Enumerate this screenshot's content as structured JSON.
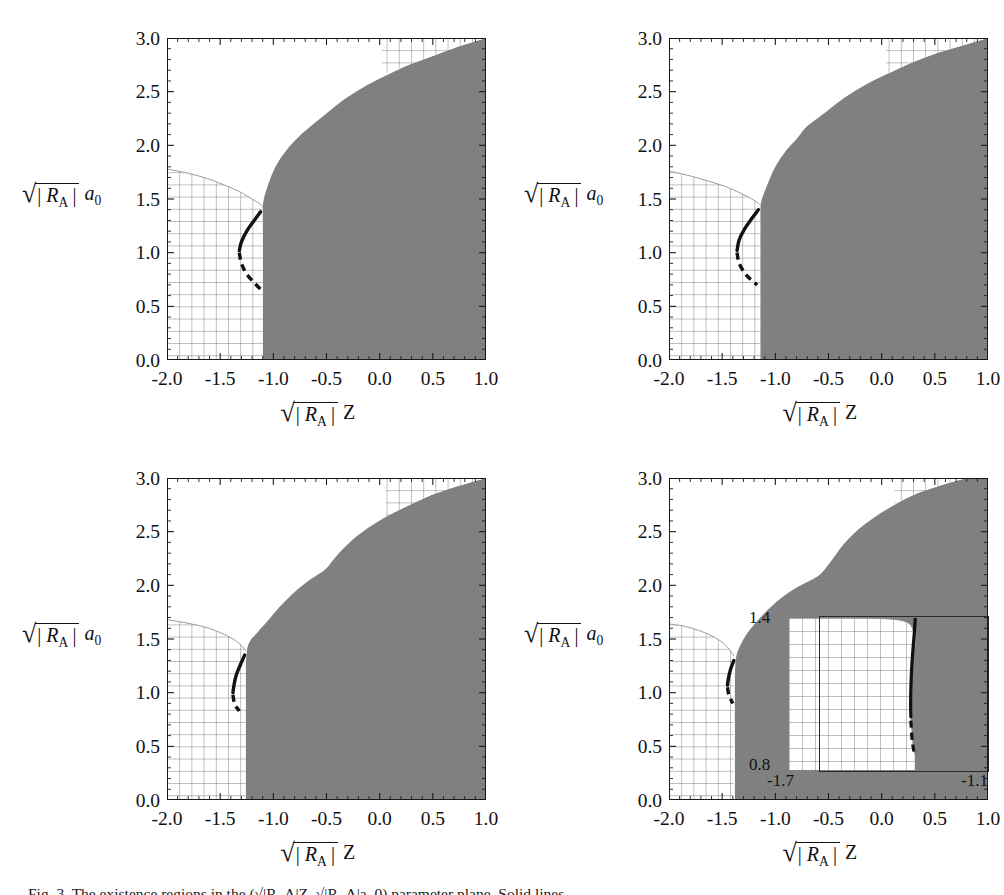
{
  "figure": {
    "panel_count": 4,
    "caption": "Fig. 3.  The existence regions in the (√|R_A|Z, √|R_A|a_0) parameter plane. Solid lines..."
  },
  "axes": {
    "x": {
      "label_parts": {
        "radical": "√",
        "bars_open": "|",
        "sym": "R",
        "sub": "A",
        "bars_close": "|",
        "var": "Z"
      },
      "ticks": [
        "-2.0",
        "-1.5",
        "-1.0",
        "-0.5",
        "0.0",
        "0.5",
        "1.0"
      ],
      "tick_values": [
        -2.0,
        -1.5,
        -1.0,
        -0.5,
        0.0,
        0.5,
        1.0
      ],
      "min": -2.0,
      "max": 1.0,
      "minor_per_major": 5
    },
    "y": {
      "label_parts": {
        "radical": "√",
        "bars_open": "|",
        "sym": "R",
        "sub": "A",
        "bars_close": "|",
        "var": "a",
        "var_sub": "0"
      },
      "ticks": [
        "0.0",
        "0.5",
        "1.0",
        "1.5",
        "2.0",
        "2.5",
        "3.0"
      ],
      "tick_values": [
        0.0,
        0.5,
        1.0,
        1.5,
        2.0,
        2.5,
        3.0
      ],
      "min": 0.0,
      "max": 3.0,
      "minor_per_major": 5
    }
  },
  "colors": {
    "shaded_region": "#808080",
    "curve": "#111111",
    "hatch_line": "#6b6b6b",
    "frame": "#1a1a1a",
    "background": "#ffffff"
  },
  "inset": {
    "panel": 3,
    "x_ticks": [
      "-1.7",
      "-1.1"
    ],
    "y_ticks": [
      "0.8",
      "1.4"
    ],
    "x_min": -1.7,
    "x_max": -1.1,
    "y_min": 0.8,
    "y_max": 1.4
  },
  "chart_data": {
    "type": "area",
    "title": "",
    "xlabel": "sqrt(|R_A|) Z",
    "ylabel": "sqrt(|R_A|) a_0",
    "xlim": [
      -2.0,
      1.0
    ],
    "ylim": [
      0.0,
      3.0
    ],
    "grid": false,
    "legend": "none",
    "panels": [
      {
        "id": "top-left",
        "shaded_boundary": [
          [
            -1.1,
            0.0
          ],
          [
            -1.1,
            0.6
          ],
          [
            -1.1,
            1.1
          ],
          [
            -1.1,
            1.42
          ],
          [
            -1.06,
            1.6
          ],
          [
            -0.98,
            1.8
          ],
          [
            -0.88,
            1.95
          ],
          [
            -0.76,
            2.08
          ],
          [
            -0.62,
            2.2
          ],
          [
            -0.46,
            2.33
          ],
          [
            -0.3,
            2.45
          ],
          [
            -0.12,
            2.56
          ],
          [
            0.08,
            2.66
          ],
          [
            0.3,
            2.76
          ],
          [
            0.52,
            2.84
          ],
          [
            0.74,
            2.92
          ],
          [
            1.0,
            3.0
          ]
        ],
        "hatch_left_boundary": [
          [
            -2.0,
            1.78
          ],
          [
            -1.8,
            1.74
          ],
          [
            -1.62,
            1.69
          ],
          [
            -1.46,
            1.63
          ],
          [
            -1.32,
            1.57
          ],
          [
            -1.2,
            1.5
          ],
          [
            -1.12,
            1.45
          ],
          [
            -1.1,
            1.42
          ]
        ],
        "hatch_topright_boundary": [
          [
            0.02,
            2.66
          ],
          [
            0.3,
            2.76
          ],
          [
            0.52,
            2.84
          ],
          [
            0.74,
            2.92
          ],
          [
            1.0,
            3.0
          ]
        ],
        "hatch_topright_xmin": 0.02,
        "hatch_topright_ymax": 3.0,
        "curve_solid": [
          [
            -1.12,
            1.38
          ],
          [
            -1.18,
            1.3
          ],
          [
            -1.25,
            1.2
          ],
          [
            -1.3,
            1.1
          ],
          [
            -1.32,
            1.02
          ]
        ],
        "curve_dashed": [
          [
            -1.32,
            1.0
          ],
          [
            -1.3,
            0.9
          ],
          [
            -1.25,
            0.8
          ],
          [
            -1.18,
            0.72
          ],
          [
            -1.12,
            0.66
          ]
        ]
      },
      {
        "id": "top-right",
        "shaded_boundary": [
          [
            -1.15,
            0.0
          ],
          [
            -1.15,
            0.7
          ],
          [
            -1.15,
            1.2
          ],
          [
            -1.14,
            1.44
          ],
          [
            -1.08,
            1.62
          ],
          [
            -1.0,
            1.8
          ],
          [
            -0.9,
            1.95
          ],
          [
            -0.8,
            2.06
          ],
          [
            -0.72,
            2.16
          ],
          [
            -0.62,
            2.24
          ],
          [
            -0.5,
            2.33
          ],
          [
            -0.34,
            2.45
          ],
          [
            -0.16,
            2.56
          ],
          [
            0.04,
            2.66
          ],
          [
            0.28,
            2.77
          ],
          [
            0.52,
            2.86
          ],
          [
            0.76,
            2.93
          ],
          [
            1.0,
            3.0
          ]
        ],
        "hatch_left_boundary": [
          [
            -2.0,
            1.76
          ],
          [
            -1.82,
            1.72
          ],
          [
            -1.64,
            1.67
          ],
          [
            -1.48,
            1.62
          ],
          [
            -1.34,
            1.56
          ],
          [
            -1.22,
            1.5
          ],
          [
            -1.16,
            1.46
          ],
          [
            -1.14,
            1.44
          ]
        ],
        "hatch_topright_boundary": [
          [
            0.04,
            2.66
          ],
          [
            0.28,
            2.77
          ],
          [
            0.52,
            2.86
          ],
          [
            0.76,
            2.93
          ],
          [
            1.0,
            3.0
          ]
        ],
        "hatch_topright_xmin": 0.04,
        "hatch_topright_ymax": 3.0,
        "curve_solid": [
          [
            -1.16,
            1.4
          ],
          [
            -1.22,
            1.32
          ],
          [
            -1.29,
            1.22
          ],
          [
            -1.34,
            1.12
          ],
          [
            -1.36,
            1.02
          ]
        ],
        "curve_dashed": [
          [
            -1.36,
            1.0
          ],
          [
            -1.34,
            0.9
          ],
          [
            -1.28,
            0.8
          ],
          [
            -1.22,
            0.74
          ],
          [
            -1.17,
            0.7
          ]
        ]
      },
      {
        "id": "bottom-left",
        "shaded_boundary": [
          [
            -1.26,
            0.0
          ],
          [
            -1.26,
            0.7
          ],
          [
            -1.26,
            1.15
          ],
          [
            -1.25,
            1.38
          ],
          [
            -1.22,
            1.48
          ],
          [
            -1.16,
            1.55
          ],
          [
            -1.06,
            1.66
          ],
          [
            -0.94,
            1.8
          ],
          [
            -0.82,
            1.92
          ],
          [
            -0.7,
            2.02
          ],
          [
            -0.58,
            2.1
          ],
          [
            -0.5,
            2.16
          ],
          [
            -0.4,
            2.28
          ],
          [
            -0.26,
            2.42
          ],
          [
            -0.1,
            2.54
          ],
          [
            0.06,
            2.64
          ],
          [
            0.26,
            2.74
          ],
          [
            0.48,
            2.84
          ],
          [
            0.72,
            2.92
          ],
          [
            1.0,
            3.0
          ]
        ],
        "hatch_left_boundary": [
          [
            -2.0,
            1.68
          ],
          [
            -1.82,
            1.65
          ],
          [
            -1.64,
            1.61
          ],
          [
            -1.5,
            1.56
          ],
          [
            -1.38,
            1.5
          ],
          [
            -1.3,
            1.44
          ],
          [
            -1.26,
            1.39
          ]
        ],
        "hatch_topright_boundary": [
          [
            0.06,
            2.64
          ],
          [
            0.26,
            2.74
          ],
          [
            0.48,
            2.84
          ],
          [
            0.72,
            2.92
          ],
          [
            1.0,
            3.0
          ]
        ],
        "hatch_topright_xmin": 0.06,
        "hatch_topright_ymax": 3.0,
        "curve_solid": [
          [
            -1.27,
            1.35
          ],
          [
            -1.31,
            1.26
          ],
          [
            -1.35,
            1.16
          ],
          [
            -1.37,
            1.07
          ],
          [
            -1.38,
            1.0
          ]
        ],
        "curve_dashed": [
          [
            -1.38,
            0.98
          ],
          [
            -1.37,
            0.92
          ],
          [
            -1.35,
            0.87
          ],
          [
            -1.32,
            0.83
          ]
        ]
      },
      {
        "id": "bottom-right",
        "shaded_boundary": [
          [
            -1.38,
            0.0
          ],
          [
            -1.38,
            0.7
          ],
          [
            -1.38,
            1.1
          ],
          [
            -1.37,
            1.32
          ],
          [
            -1.33,
            1.44
          ],
          [
            -1.26,
            1.56
          ],
          [
            -1.16,
            1.68
          ],
          [
            -1.04,
            1.8
          ],
          [
            -0.92,
            1.9
          ],
          [
            -0.8,
            1.98
          ],
          [
            -0.68,
            2.04
          ],
          [
            -0.58,
            2.1
          ],
          [
            -0.48,
            2.22
          ],
          [
            -0.36,
            2.38
          ],
          [
            -0.22,
            2.52
          ],
          [
            -0.06,
            2.64
          ],
          [
            0.14,
            2.76
          ],
          [
            0.34,
            2.86
          ],
          [
            0.58,
            2.94
          ],
          [
            0.8,
            3.0
          ]
        ],
        "hatch_left_boundary": [
          [
            -2.0,
            1.64
          ],
          [
            -1.86,
            1.62
          ],
          [
            -1.72,
            1.58
          ],
          [
            -1.6,
            1.53
          ],
          [
            -1.5,
            1.47
          ],
          [
            -1.43,
            1.4
          ],
          [
            -1.39,
            1.34
          ]
        ],
        "hatch_topright_boundary": [
          [
            0.12,
            2.76
          ],
          [
            0.34,
            2.86
          ],
          [
            0.58,
            2.94
          ],
          [
            0.8,
            3.0
          ]
        ],
        "hatch_topright_xmin": 0.12,
        "hatch_topright_ymax": 3.0,
        "curve_solid": [
          [
            -1.39,
            1.3
          ],
          [
            -1.42,
            1.22
          ],
          [
            -1.44,
            1.14
          ],
          [
            -1.45,
            1.07
          ]
        ],
        "curve_dashed": [
          [
            -1.45,
            1.05
          ],
          [
            -1.44,
            0.99
          ],
          [
            -1.42,
            0.94
          ],
          [
            -1.4,
            0.9
          ]
        ],
        "inset_curve_solid": [
          [
            -1.188,
            1.4
          ],
          [
            -1.192,
            1.34
          ],
          [
            -1.198,
            1.27
          ],
          [
            -1.203,
            1.195
          ],
          [
            -1.206,
            1.12
          ],
          [
            -1.207,
            1.06
          ],
          [
            -1.206,
            1.01
          ]
        ],
        "inset_curve_dashed": [
          [
            -1.206,
            0.995
          ],
          [
            -1.203,
            0.945
          ],
          [
            -1.199,
            0.905
          ],
          [
            -1.194,
            0.875
          ],
          [
            -1.19,
            0.858
          ]
        ],
        "inset_hatch_right_boundary": [
          [
            -1.7,
            1.4
          ],
          [
            -1.42,
            1.4
          ],
          [
            -1.28,
            1.395
          ],
          [
            -1.22,
            1.382
          ],
          [
            -1.2,
            1.36
          ],
          [
            -1.192,
            1.33
          ],
          [
            -1.188,
            1.29
          ]
        ]
      }
    ]
  }
}
